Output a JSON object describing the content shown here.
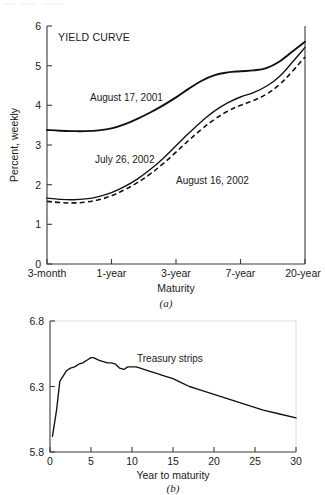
{
  "figure": {
    "panels": [
      {
        "caption": "(a)",
        "title": "YIELD CURVE",
        "ylabel": "Percent, weekly",
        "xlabel": "Maturity"
      },
      {
        "caption": "(b)",
        "xlabel": "Year to maturity"
      }
    ]
  },
  "chart_data": [
    {
      "type": "line",
      "title": "YIELD CURVE",
      "xlabel": "Maturity",
      "ylabel": "Percent, weekly",
      "panel": "(a)",
      "grid": false,
      "legend": "inline-annotations",
      "categories": [
        "3-month",
        "1-year",
        "3-year",
        "7-year",
        "20-year"
      ],
      "xtick_labels": [
        "3-month",
        "1-year",
        "3-year",
        "7-year",
        "20-year"
      ],
      "xtick_positions": [
        0,
        1,
        2,
        3,
        4
      ],
      "xlim": [
        0,
        4
      ],
      "ylim": [
        0,
        6
      ],
      "ytick_labels": [
        "0",
        "1",
        "2",
        "3",
        "4",
        "5",
        "6"
      ],
      "ytick_values": [
        0,
        1,
        2,
        3,
        4,
        5,
        6
      ],
      "series": [
        {
          "name": "August 17, 2001",
          "style": "solid-thick",
          "label_position": "upper-left",
          "x": [
            0.0,
            0.2,
            0.4,
            0.6,
            0.8,
            1.0,
            1.2,
            1.4,
            1.6,
            1.8,
            2.0,
            2.2,
            2.4,
            2.6,
            2.8,
            3.0,
            3.2,
            3.4,
            3.6,
            3.8,
            4.0
          ],
          "values": [
            3.38,
            3.36,
            3.35,
            3.35,
            3.37,
            3.42,
            3.52,
            3.66,
            3.82,
            4.0,
            4.2,
            4.42,
            4.62,
            4.76,
            4.83,
            4.86,
            4.88,
            4.94,
            5.1,
            5.35,
            5.6
          ]
        },
        {
          "name": "July 26, 2002",
          "style": "solid-thin",
          "label_position": "middle-left",
          "x": [
            0.0,
            0.2,
            0.4,
            0.6,
            0.8,
            1.0,
            1.2,
            1.4,
            1.6,
            1.8,
            2.0,
            2.2,
            2.4,
            2.6,
            2.8,
            3.0,
            3.2,
            3.4,
            3.6,
            3.8,
            4.0
          ],
          "values": [
            1.66,
            1.63,
            1.62,
            1.64,
            1.7,
            1.8,
            1.95,
            2.14,
            2.38,
            2.66,
            2.98,
            3.3,
            3.6,
            3.86,
            4.06,
            4.21,
            4.32,
            4.48,
            4.72,
            5.08,
            5.46
          ]
        },
        {
          "name": "August 16, 2002",
          "style": "dashed",
          "label_position": "middle-right",
          "x": [
            0.0,
            0.2,
            0.4,
            0.6,
            0.8,
            1.0,
            1.2,
            1.4,
            1.6,
            1.8,
            2.0,
            2.2,
            2.4,
            2.6,
            2.8,
            3.0,
            3.2,
            3.4,
            3.6,
            3.8,
            4.0
          ],
          "values": [
            1.58,
            1.55,
            1.54,
            1.56,
            1.62,
            1.72,
            1.87,
            2.05,
            2.27,
            2.53,
            2.82,
            3.12,
            3.4,
            3.65,
            3.85,
            4.0,
            4.12,
            4.28,
            4.52,
            4.85,
            5.22
          ]
        }
      ]
    },
    {
      "type": "line",
      "panel": "(b)",
      "xlabel": "Year to maturity",
      "ylabel": "",
      "grid": false,
      "legend": "inline-annotation",
      "xlim": [
        0,
        30
      ],
      "ylim": [
        5.8,
        6.8
      ],
      "xtick_labels": [
        "0",
        "5",
        "10",
        "15",
        "20",
        "25",
        "30"
      ],
      "xtick_values": [
        0,
        5,
        10,
        15,
        20,
        25,
        30
      ],
      "ytick_labels": [
        "5.8",
        "6.3",
        "6.8"
      ],
      "ytick_values": [
        5.8,
        6.3,
        6.8
      ],
      "series": [
        {
          "name": "Treasury strips",
          "style": "solid-thin",
          "label_position": "upper-middle",
          "x": [
            0.3,
            0.8,
            1.2,
            1.5,
            2.0,
            2.5,
            3.0,
            3.5,
            4.0,
            4.5,
            5.0,
            5.3,
            6.0,
            6.5,
            7.0,
            7.5,
            8.0,
            8.5,
            9.0,
            9.5,
            10.0,
            10.5,
            11.0,
            12.0,
            13.0,
            14.0,
            15.0,
            16.0,
            17.0,
            18.0,
            20.0,
            22.0,
            24.0,
            26.0,
            28.0,
            30.0
          ],
          "values": [
            5.92,
            6.12,
            6.34,
            6.37,
            6.42,
            6.44,
            6.45,
            6.47,
            6.48,
            6.5,
            6.52,
            6.52,
            6.5,
            6.49,
            6.48,
            6.48,
            6.47,
            6.44,
            6.43,
            6.45,
            6.45,
            6.45,
            6.44,
            6.42,
            6.4,
            6.38,
            6.36,
            6.33,
            6.3,
            6.28,
            6.24,
            6.2,
            6.16,
            6.12,
            6.09,
            6.06
          ]
        }
      ]
    }
  ]
}
